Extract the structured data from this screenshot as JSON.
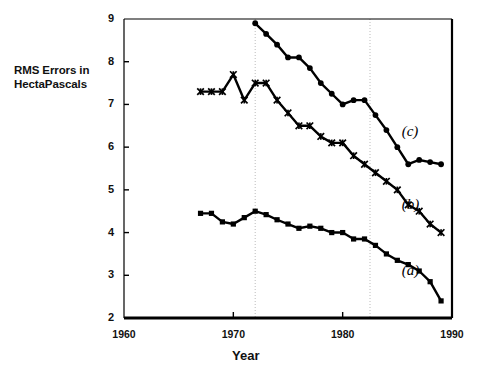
{
  "chart_data": {
    "type": "line",
    "title": "",
    "xlabel": "Year",
    "ylabel": "RMS Errors in HectaPascals",
    "ylabel_lines": [
      "RMS Errors in",
      "HectaPascals"
    ],
    "xlim": [
      1960,
      1990
    ],
    "ylim": [
      2,
      9
    ],
    "xticks": [
      1960,
      1970,
      1980,
      1990
    ],
    "yticks": [
      2,
      3,
      4,
      5,
      6,
      7,
      8,
      9
    ],
    "grid": "vertical dotted gridlines at 1972 and 1982.5",
    "gridlines_x": [
      1972,
      1982.5
    ],
    "legend": "inline curve labels (a), (b), (c) at right",
    "colors": {
      "ink": "#000000",
      "background": "#ffffff",
      "grid": "#bbbbbb"
    },
    "series": [
      {
        "name": "(a)",
        "label": "(a)",
        "marker": "filled-square",
        "label_x": 1985.4,
        "label_y": 3.05,
        "x": [
          1967,
          1968,
          1969,
          1970,
          1971,
          1972,
          1973,
          1974,
          1975,
          1976,
          1977,
          1978,
          1979,
          1980,
          1981,
          1982,
          1983,
          1984,
          1985,
          1986,
          1987,
          1988,
          1989
        ],
        "y": [
          4.45,
          4.45,
          4.25,
          4.2,
          4.35,
          4.5,
          4.42,
          4.3,
          4.2,
          4.1,
          4.15,
          4.1,
          4.0,
          4.0,
          3.85,
          3.85,
          3.7,
          3.5,
          3.35,
          3.25,
          3.1,
          2.85,
          2.4
        ]
      },
      {
        "name": "(b)",
        "label": "(b)",
        "marker": "star-x",
        "label_x": 1985.4,
        "label_y": 4.6,
        "x": [
          1967,
          1968,
          1969,
          1970,
          1971,
          1972,
          1973,
          1974,
          1975,
          1976,
          1977,
          1978,
          1979,
          1980,
          1981,
          1982,
          1983,
          1984,
          1985,
          1986,
          1987,
          1988,
          1989
        ],
        "y": [
          7.3,
          7.3,
          7.3,
          7.7,
          7.1,
          7.5,
          7.5,
          7.1,
          6.8,
          6.5,
          6.5,
          6.25,
          6.1,
          6.1,
          5.8,
          5.6,
          5.4,
          5.2,
          5.0,
          4.65,
          4.5,
          4.2,
          4.0
        ]
      },
      {
        "name": "(c)",
        "label": "(c)",
        "marker": "filled-circle",
        "label_x": 1985.4,
        "label_y": 6.3,
        "x": [
          1972,
          1973,
          1974,
          1975,
          1976,
          1977,
          1978,
          1979,
          1980,
          1981,
          1982,
          1983,
          1984,
          1985,
          1986,
          1987,
          1988,
          1989
        ],
        "y": [
          8.9,
          8.65,
          8.4,
          8.1,
          8.1,
          7.85,
          7.5,
          7.25,
          7.0,
          7.1,
          7.1,
          6.75,
          6.4,
          6.0,
          5.6,
          5.7,
          5.65,
          5.6
        ]
      }
    ]
  }
}
